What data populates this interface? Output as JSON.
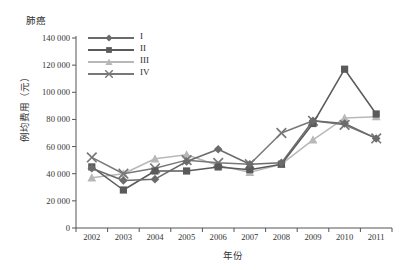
{
  "chart_data": {
    "type": "line",
    "title": "肺癌",
    "xlabel": "年份",
    "ylabel": "例均费用（元）",
    "categories": [
      "2002",
      "2003",
      "2004",
      "2005",
      "2006",
      "2007",
      "2008",
      "2009",
      "2010",
      "2011"
    ],
    "x": [
      2002,
      2003,
      2004,
      2005,
      2006,
      2007,
      2008,
      2009,
      2010,
      2011
    ],
    "ylim": [
      0,
      140000
    ],
    "ytick_labels": [
      "140 000",
      "120 000",
      "100 000",
      "80 000",
      "60 000",
      "40 000",
      "20 000",
      "0"
    ],
    "ytick_values": [
      140000,
      120000,
      100000,
      80000,
      60000,
      40000,
      20000,
      0
    ],
    "ytick_step": 20000,
    "grid": false,
    "legend_position": "top-left inside",
    "series": [
      {
        "name": "I",
        "marker": "diamond",
        "color": "#6b6b6b",
        "values": [
          44000,
          35000,
          36000,
          49000,
          58000,
          47000,
          48000,
          79000,
          77000,
          66000
        ]
      },
      {
        "name": "II",
        "marker": "square",
        "color": "#5a5a5a",
        "values": [
          45000,
          28000,
          42000,
          42000,
          45000,
          43000,
          47000,
          77000,
          117000,
          84000
        ]
      },
      {
        "name": "III",
        "marker": "triangle",
        "color": "#b8b8b8",
        "values": [
          37000,
          40000,
          51000,
          54000,
          46000,
          41000,
          47000,
          65000,
          81000,
          82000
        ]
      },
      {
        "name": "IV",
        "marker": "cross",
        "color": "#787878",
        "values": [
          52000,
          40000,
          44000,
          50000,
          48000,
          47000,
          70000,
          79000,
          76000,
          66000
        ]
      }
    ]
  },
  "axes": {
    "axis_color": "#555555"
  }
}
